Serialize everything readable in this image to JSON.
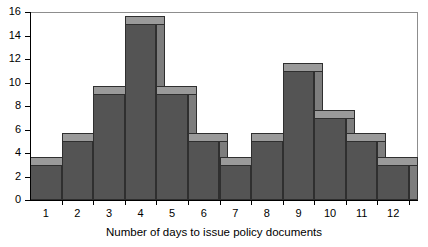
{
  "chart_data": {
    "type": "bar",
    "title": "",
    "subtitle": "",
    "xlabel": "Number of days to issue policy documents",
    "ylabel": "",
    "categories": [
      "1",
      "2",
      "3",
      "4",
      "5",
      "6",
      "7",
      "8",
      "9",
      "10",
      "11",
      "12"
    ],
    "values": [
      3,
      5,
      9,
      15,
      9,
      5,
      3,
      5,
      11,
      7,
      5,
      3
    ],
    "series": [
      {
        "name": "Frequency",
        "values": [
          3,
          5,
          9,
          15,
          9,
          5,
          3,
          5,
          11,
          7,
          5,
          3
        ]
      }
    ],
    "ylim": [
      0,
      16
    ],
    "xlim": [
      0,
      12
    ],
    "y_ticks": [
      0,
      2,
      4,
      6,
      8,
      10,
      12,
      14,
      16
    ],
    "y_tick_labels": [
      "0",
      "2",
      "4",
      "6",
      "8",
      "10",
      "12",
      "14",
      "16"
    ],
    "x_tick_labels": [
      "1",
      "2",
      "3",
      "4",
      "5",
      "6",
      "7",
      "8",
      "9",
      "10",
      "11",
      "12"
    ],
    "grid": false,
    "legend": false,
    "legend_position": "none",
    "style": "3d-histogram",
    "bar_gap": 0,
    "colors": {
      "bar_front": "#545454",
      "bar_top": "#9a9a9a",
      "bar_side": "#7d7d7d",
      "bar_outline": "#2f2f2f",
      "axis": "#000000",
      "frame": "#8d8d8d",
      "background": "#ffffff",
      "text": "#000000"
    }
  }
}
